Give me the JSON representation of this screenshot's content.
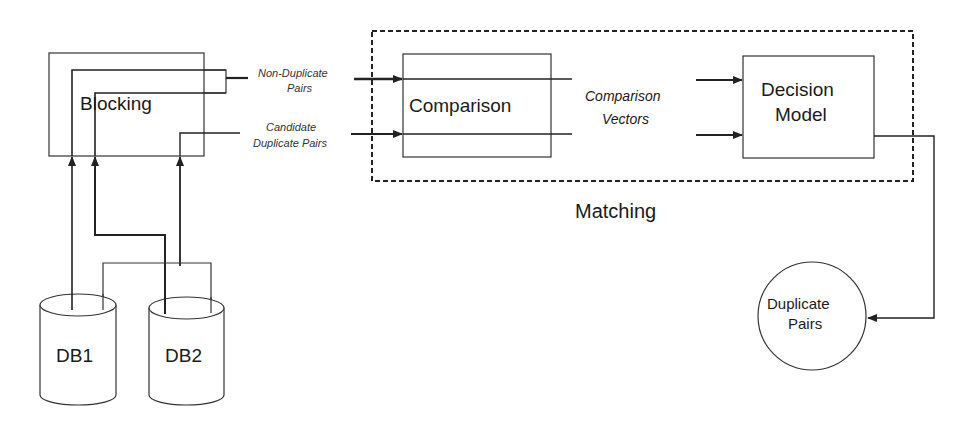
{
  "diagram": {
    "colors": {
      "stroke": "#222222",
      "background": "#ffffff",
      "text": "#1a1a1a"
    },
    "nodes": {
      "blocking": {
        "label": "Blocking",
        "shape": "rectangle"
      },
      "comparison": {
        "label": "Comparison",
        "shape": "rectangle"
      },
      "decision_model": {
        "label_line1": "Decision",
        "label_line2": "Model",
        "shape": "rectangle"
      },
      "db1": {
        "label": "DB1",
        "shape": "cylinder"
      },
      "db2": {
        "label": "DB2",
        "shape": "cylinder"
      },
      "duplicate_pairs": {
        "label_line1": "Duplicate",
        "label_line2": "Pairs",
        "shape": "circle"
      }
    },
    "groups": {
      "matching": {
        "label": "Matching",
        "style": "dashed"
      }
    },
    "edge_labels": {
      "non_duplicate_line1": "Non-Duplicate",
      "non_duplicate_line2": "Pairs",
      "candidate_line1": "Candidate",
      "candidate_line2": "Duplicate Pairs",
      "comparison_vectors_line1": "Comparison",
      "comparison_vectors_line2": "Vectors"
    },
    "edges": [
      {
        "from": "db1",
        "to": "blocking"
      },
      {
        "from": "db2",
        "to": "blocking"
      },
      {
        "from": "db1+db2",
        "to": "blocking"
      },
      {
        "from": "blocking",
        "to": "comparison",
        "label": "Non-Duplicate Pairs"
      },
      {
        "from": "blocking",
        "to": "comparison",
        "label": "Candidate Duplicate Pairs"
      },
      {
        "from": "comparison",
        "to": "decision_model",
        "label": "Comparison Vectors"
      },
      {
        "from": "decision_model",
        "to": "duplicate_pairs"
      }
    ]
  }
}
